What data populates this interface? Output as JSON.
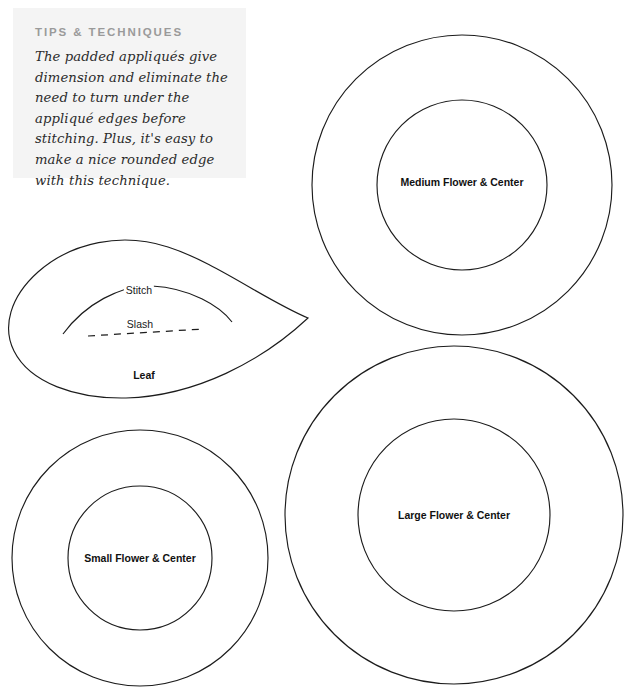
{
  "page": {
    "background_color": "#ffffff",
    "ink_color": "#1c1c1c",
    "width": 632,
    "height": 694
  },
  "tips": {
    "heading": "TIPS & TECHNIQUES",
    "body": "The padded appliqués give dimension and eliminate the need to turn under the appliqué edges before stitching. Plus, it's easy to make a nice rounded edge with this technique.",
    "background_color": "#f4f4f4",
    "heading_color": "#9a9a9a"
  },
  "templates": [
    {
      "id": "leaf",
      "label": "Leaf",
      "type": "teardrop",
      "guides": [
        {
          "id": "stitch",
          "label": "Stitch",
          "style": "solid"
        },
        {
          "id": "slash",
          "label": "Slash",
          "style": "dashed"
        }
      ]
    },
    {
      "id": "medium-flower",
      "label": "Medium Flower & Center",
      "type": "concentric-circles"
    },
    {
      "id": "small-flower",
      "label": "Small Flower & Center",
      "type": "concentric-circles"
    },
    {
      "id": "large-flower",
      "label": "Large Flower & Center",
      "type": "concentric-circles"
    }
  ],
  "footer": {
    "note": ""
  }
}
